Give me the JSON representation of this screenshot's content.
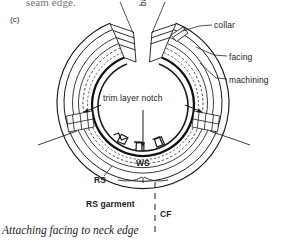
{
  "figure": {
    "subfigure_label": "(c)",
    "caption": "Attaching facing to neck edge",
    "continued_text_above": "seam edge.",
    "colors": {
      "ink": "#1a1a1a",
      "paper": "#ffffff",
      "heavy_stroke": "#111111",
      "light_stroke": "#555555"
    }
  },
  "callouts": {
    "back_opening": "back opening",
    "collar": "collar",
    "facing": "facing",
    "machining": "machining",
    "trim_layer_notch": "trim layer notch",
    "ws": "WS",
    "rs": "RS",
    "rs_garment": "RS garment",
    "cf": "CF"
  },
  "diagram": {
    "type": "technical-illustration",
    "center": {
      "x": 143,
      "y": 107
    },
    "rings": [
      {
        "name": "outer-garment-edge",
        "radius": 78
      },
      {
        "name": "collar-outer",
        "radius": 70
      },
      {
        "name": "facing-outer",
        "radius": 63
      },
      {
        "name": "machining-stitchline",
        "radius": 57,
        "dashed": true
      },
      {
        "name": "neck-seam",
        "radius": 48
      },
      {
        "name": "inner-neck-edge",
        "radius": 42
      }
    ],
    "gap": {
      "name": "back-opening-gap",
      "start_deg": -104,
      "end_deg": -76
    },
    "notches": [
      {
        "angle_deg": 60
      },
      {
        "angle_deg": 90
      },
      {
        "angle_deg": 120
      }
    ],
    "side_tabs": [
      {
        "name": "left-shoulder-tab",
        "angle_deg": 183
      },
      {
        "name": "right-shoulder-tab",
        "angle_deg": 3
      }
    ],
    "shoulder_lines": [
      {
        "name": "left-shoulder-seam"
      },
      {
        "name": "right-shoulder-seam"
      }
    ],
    "cf_line": {
      "name": "centre-front-line",
      "dashed": true,
      "from_y": 180,
      "to_y": 232
    }
  }
}
